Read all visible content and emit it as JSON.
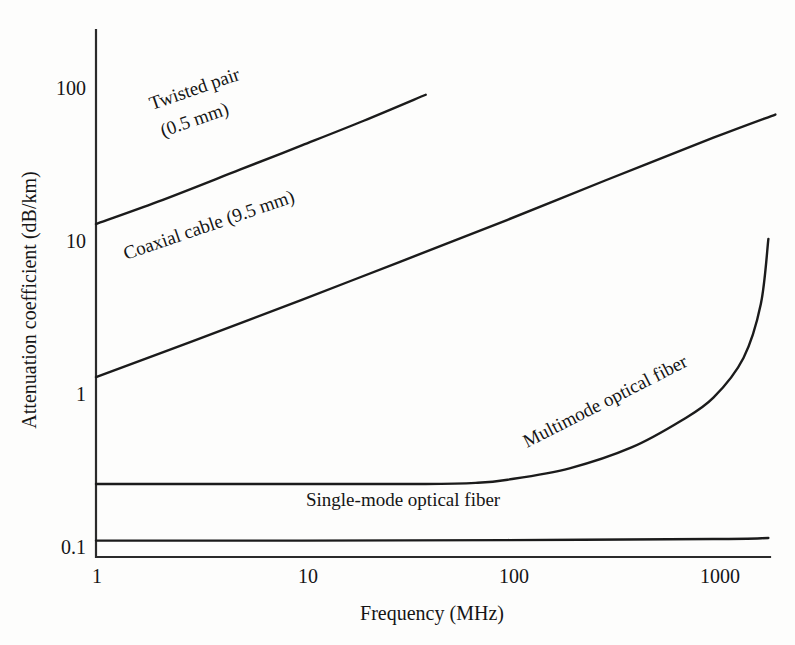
{
  "figure": {
    "background_color": "#fdfdfc",
    "line_color": "#1b1b1b",
    "axis_color": "#2b2b2b"
  },
  "chart_data": {
    "type": "line",
    "title": "",
    "subtitle": "",
    "xlabel": "Frequency (MHz)",
    "ylabel": "Attenuation coefficient (dB/km)",
    "xscale": "log",
    "yscale": "log",
    "xlim": [
      1,
      2000
    ],
    "ylim": [
      0.1,
      250
    ],
    "grid": false,
    "legend_position": "inline-labels",
    "xticks": [
      1,
      10,
      100,
      1000
    ],
    "xticklabels": [
      "1",
      "10",
      "100",
      "1000"
    ],
    "yticks": [
      0.1,
      1,
      10,
      100
    ],
    "yticklabels": [
      "0.1",
      "1",
      "10",
      "100"
    ],
    "series": [
      {
        "name": "Twisted pair (0.5 mm)",
        "label_line1": "Twisted pair",
        "label_line2": "(0.5 mm)",
        "x": [
          1,
          2,
          5,
          10,
          20,
          40
        ],
        "y": [
          15,
          21,
          34,
          49,
          71,
          105
        ],
        "annotation_rotation_deg": -20
      },
      {
        "name": "Coaxial cable (9.5 mm)",
        "label_line1": "Coaxial cable (9.5 mm)",
        "label_line2": "",
        "x": [
          1,
          3,
          10,
          30,
          100,
          300,
          1000,
          2000
        ],
        "y": [
          1.5,
          2.6,
          4.8,
          8.5,
          16,
          29,
          55,
          78
        ],
        "annotation_rotation_deg": -20
      },
      {
        "name": "Multimode optical fiber",
        "label_line1": "Multimode optical fiber",
        "label_line2": "",
        "x": [
          1,
          10,
          40,
          70,
          100,
          200,
          400,
          700,
          1000,
          1400,
          1700,
          1850
        ],
        "y": [
          0.3,
          0.3,
          0.3,
          0.305,
          0.32,
          0.38,
          0.52,
          0.78,
          1.1,
          2.0,
          4.5,
          12
        ],
        "annotation_rotation_deg": -27
      },
      {
        "name": "Single-mode optical fiber",
        "label_line1": "Single-mode optical fiber",
        "label_line2": "",
        "x": [
          1,
          10,
          100,
          1000,
          1850
        ],
        "y": [
          0.128,
          0.128,
          0.129,
          0.131,
          0.133
        ],
        "annotation_rotation_deg": 0
      }
    ]
  },
  "axes": {
    "y_axis_title": "Attenuation coefficient (dB/km)",
    "x_axis_title": "Frequency (MHz)"
  },
  "annotations": {
    "twisted_pair_l1": "Twisted pair",
    "twisted_pair_l2": "(0.5 mm)",
    "coaxial": "Coaxial cable (9.5 mm)",
    "multimode": "Multimode optical fiber",
    "singlemode": "Single-mode optical fiber"
  }
}
